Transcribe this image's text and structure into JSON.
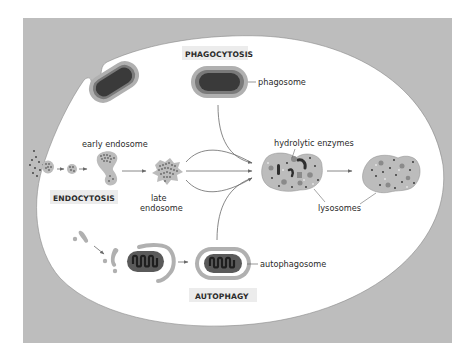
{
  "figure": {
    "colors": {
      "background_frame": "#bdbdbd",
      "cell_interior": "#ffffff",
      "membrane_light": "#b0b0b0",
      "membrane_mid": "#7a7a7a",
      "dark_content": "#3a3a3a",
      "lysosome_fill": "#bcbcbc",
      "label_box": "#ececec",
      "line": "#6a6a6a"
    },
    "process_labels": {
      "phagocytosis": "PHAGOCYTOSIS",
      "endocytosis": "ENDOCYTOSIS",
      "autophagy": "AUTOPHAGY"
    },
    "structure_labels": {
      "phagosome": "phagosome",
      "early_endosome": "early endosome",
      "late_endosome_line1": "late",
      "late_endosome_line2": "endosome",
      "hydrolytic_enzymes": "hydrolytic enzymes",
      "lysosomes": "lysosomes",
      "autophagosome": "autophagosome"
    }
  }
}
